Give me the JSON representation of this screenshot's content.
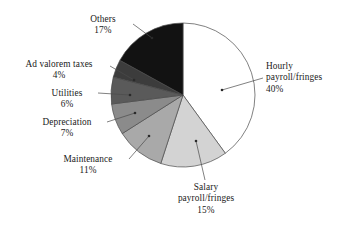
{
  "chart_data": {
    "type": "pie",
    "title": "",
    "subtitle": "",
    "xlabel": "",
    "ylabel": "",
    "legend_position": "none",
    "grid": false,
    "unit": "%",
    "start_angle_deg": 0,
    "direction": "clockwise",
    "categories": [
      "Hourly payroll/fringes",
      "Salary payroll/fringes",
      "Maintenance",
      "Depreciation",
      "Utilities",
      "Ad valorem taxes",
      "Others"
    ],
    "values": [
      40,
      15,
      11,
      7,
      6,
      4,
      17
    ],
    "slices": [
      {
        "name": "hourly-payroll-fringes",
        "label_lines": [
          "Hourly",
          "payroll/fringes",
          "40%"
        ],
        "value": 40,
        "value_text": "40%",
        "color": "#ffffff"
      },
      {
        "name": "salary-payroll-fringes",
        "label_lines": [
          "Salary",
          "payroll/fringes",
          "15%"
        ],
        "value": 15,
        "value_text": "15%",
        "color": "#d3d3d3"
      },
      {
        "name": "maintenance",
        "label_lines": [
          "Maintenance",
          "11%"
        ],
        "value": 11,
        "value_text": "11%",
        "color": "#a9a9a9"
      },
      {
        "name": "depreciation",
        "label_lines": [
          "Depreciation",
          "7%"
        ],
        "value": 7,
        "value_text": "7%",
        "color": "#8b8b8b"
      },
      {
        "name": "utilities",
        "label_lines": [
          "Utilities",
          "6%"
        ],
        "value": 6,
        "value_text": "6%",
        "color": "#5a5a5a"
      },
      {
        "name": "ad-valorem-taxes",
        "label_lines": [
          "Ad valorem taxes",
          "4%"
        ],
        "value": 4,
        "value_text": "4%",
        "color": "#3c3c3c"
      },
      {
        "name": "others",
        "label_lines": [
          "Others",
          "17%"
        ],
        "value": 17,
        "value_text": "17%",
        "color": "#121212"
      }
    ],
    "colors": {
      "outline": "#4a4a4a",
      "leader_line": "#4a4a4a",
      "text": "#1a1a1a",
      "background": "#ffffff"
    }
  },
  "labels": {
    "hourly": {
      "l1": "Hourly",
      "l2": "payroll/fringes",
      "l3": "40%"
    },
    "salary": {
      "l1": "Salary",
      "l2": "payroll/fringes",
      "l3": "15%"
    },
    "maintenance": {
      "l1": "Maintenance",
      "l2": "11%"
    },
    "depreciation": {
      "l1": "Depreciation",
      "l2": "7%"
    },
    "utilities": {
      "l1": "Utilities",
      "l2": "6%"
    },
    "advalorem": {
      "l1": "Ad valorem taxes",
      "l2": "4%"
    },
    "others": {
      "l1": "Others",
      "l2": "17%"
    }
  }
}
